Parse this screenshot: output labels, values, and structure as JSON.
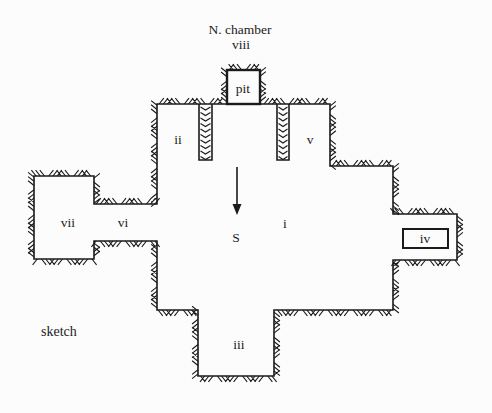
{
  "figure": {
    "caption": "sketch",
    "canvas": {
      "w": 492,
      "h": 413
    },
    "background": "#fcfcfc",
    "ink": "#1b1b1b"
  },
  "plan": {
    "wall_stroke_width": 1.6,
    "hatch": {
      "spacing": 4.2,
      "length": 7.5,
      "slant": 0.8,
      "group_size": 3,
      "stroke_width": 1.1
    },
    "outline": [
      [
        157,
        104
      ],
      [
        330,
        104
      ],
      [
        330,
        166
      ],
      [
        393,
        166
      ],
      [
        393,
        214
      ],
      [
        457,
        214
      ],
      [
        457,
        260
      ],
      [
        393,
        260
      ],
      [
        393,
        310
      ],
      [
        274,
        310
      ],
      [
        274,
        376
      ],
      [
        198,
        376
      ],
      [
        198,
        310
      ],
      [
        157,
        310
      ],
      [
        157,
        241
      ],
      [
        94,
        241
      ],
      [
        94,
        259
      ],
      [
        34,
        259
      ],
      [
        34,
        176
      ],
      [
        94,
        176
      ],
      [
        94,
        204
      ],
      [
        157,
        204
      ]
    ],
    "hatch_paths": [
      [
        [
          157,
          104
        ],
        [
          224,
          104
        ]
      ],
      [
        [
          262,
          104
        ],
        [
          330,
          104
        ],
        [
          330,
          166
        ],
        [
          393,
          166
        ],
        [
          393,
          214
        ],
        [
          457,
          214
        ],
        [
          457,
          260
        ],
        [
          393,
          260
        ],
        [
          393,
          310
        ],
        [
          274,
          310
        ],
        [
          274,
          376
        ],
        [
          198,
          376
        ],
        [
          198,
          310
        ],
        [
          157,
          310
        ],
        [
          157,
          241
        ],
        [
          94,
          241
        ],
        [
          94,
          259
        ],
        [
          34,
          259
        ],
        [
          34,
          176
        ],
        [
          94,
          176
        ],
        [
          94,
          204
        ],
        [
          157,
          204
        ],
        [
          157,
          104
        ]
      ],
      [
        [
          227,
          104
        ],
        [
          227,
          70
        ],
        [
          260,
          70
        ],
        [
          260,
          104
        ]
      ]
    ],
    "partitions": [
      {
        "x1": 199,
        "x2": 212,
        "y_top": 104,
        "y_bottom": 160
      },
      {
        "x1": 277,
        "x2": 289,
        "y_top": 104,
        "y_bottom": 160
      }
    ],
    "pit_box": {
      "x": 227,
      "y": 70,
      "w": 33,
      "h": 34,
      "stroke_width": 2.4
    },
    "iv_box": {
      "x": 403,
      "y": 229,
      "w": 45,
      "h": 19,
      "stroke_width": 2
    },
    "arrow": {
      "x": 237,
      "y_start": 167,
      "y_end": 205,
      "tip_y": 215,
      "half_width": 4.5,
      "stroke_width": 1.6
    },
    "labels": [
      {
        "id": "north-chamber",
        "text": "N. chamber",
        "x": 240,
        "y": 34,
        "size": 13.5,
        "anchor": "middle"
      },
      {
        "id": "viii",
        "text": "viii",
        "x": 241,
        "y": 49,
        "size": 13.5,
        "anchor": "middle"
      },
      {
        "id": "pit",
        "text": "pit",
        "x": 243,
        "y": 93,
        "size": 13.5,
        "anchor": "middle"
      },
      {
        "id": "ii",
        "text": "ii",
        "x": 178,
        "y": 144,
        "size": 13.5,
        "anchor": "middle"
      },
      {
        "id": "v",
        "text": "v",
        "x": 310,
        "y": 144,
        "size": 13.5,
        "anchor": "middle"
      },
      {
        "id": "vii",
        "text": "vii",
        "x": 68,
        "y": 227,
        "size": 13.5,
        "anchor": "middle"
      },
      {
        "id": "vi",
        "text": "vi",
        "x": 123,
        "y": 227,
        "size": 13.5,
        "anchor": "middle"
      },
      {
        "id": "i",
        "text": "i",
        "x": 285,
        "y": 228,
        "size": 13.5,
        "anchor": "middle"
      },
      {
        "id": "s",
        "text": "S",
        "x": 236,
        "y": 242,
        "size": 13.5,
        "anchor": "middle"
      },
      {
        "id": "iv",
        "text": "iv",
        "x": 425,
        "y": 243,
        "size": 13.5,
        "anchor": "middle"
      },
      {
        "id": "iii",
        "text": "iii",
        "x": 239,
        "y": 349,
        "size": 13.5,
        "anchor": "middle"
      },
      {
        "id": "sketch",
        "text": "sketch",
        "x": 41,
        "y": 336,
        "size": 14,
        "anchor": "start"
      }
    ]
  }
}
